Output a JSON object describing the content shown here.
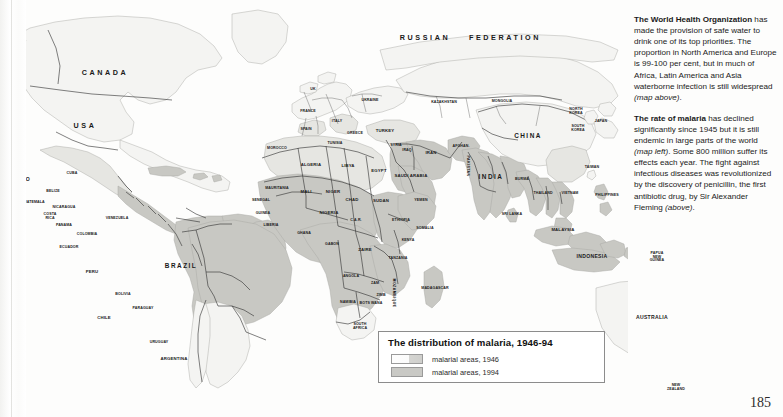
{
  "page": {
    "number": "185"
  },
  "legend": {
    "title": "The distribution of malaria, 1946-94",
    "entries": [
      {
        "label": "malarial areas, 1946",
        "swatch": "light-outline",
        "color": "#fbfbfb"
      },
      {
        "label": "malarial areas, 1994",
        "swatch": "gray-fill",
        "color": "#c9c9c5"
      }
    ]
  },
  "sidebar": {
    "paragraphs": [
      {
        "lead": "The World Health Organization",
        "body": " has made the provision of safe water to drink one of its top priorities. The proportion in North America and Europe is 99-100 per cent, but in much of Africa, Latin America and Asia waterborne infection is still widespread ",
        "italic_tail": "(map above)",
        "end": "."
      },
      {
        "lead": "The rate of malaria",
        "body": " has declined significantly since 1945 but it is still endemic in large parts of the world ",
        "italic_mid": "(map left)",
        "body2": ". Some 800 million suffer its effects each year. The fight against infectious diseases was revolutionized by the discovery of penicillin, the first antibiotic drug, by Sir Alexander Fleming ",
        "italic_tail": "(above)",
        "end": "."
      }
    ]
  },
  "map": {
    "colors": {
      "ocean": "#fdfdfc",
      "land_clear": "#f2f2f0",
      "malaria_1946": "#e3e3df",
      "malaria_1994": "#c6c6c1",
      "border": "#3a3a3a",
      "coast": "#9a9a96"
    },
    "labels": [
      {
        "text": "CANADA",
        "x": 105,
        "y": 73,
        "size": "xl"
      },
      {
        "text": "USA",
        "x": 85,
        "y": 126,
        "size": "xl"
      },
      {
        "text": "MEXICO",
        "x": 19,
        "y": 180,
        "size": "m"
      },
      {
        "text": "CUBA",
        "x": 72,
        "y": 174,
        "size": "xs"
      },
      {
        "text": "BELIZE",
        "x": 53,
        "y": 192,
        "size": "xs"
      },
      {
        "text": "GUATEMALA",
        "x": 33,
        "y": 203,
        "size": "xs"
      },
      {
        "text": "NICARAGUA",
        "x": 64,
        "y": 208,
        "size": "xs"
      },
      {
        "text": "COSTA RICA",
        "x": 50,
        "y": 217,
        "size": "xs"
      },
      {
        "text": "PANAMA",
        "x": 64,
        "y": 226,
        "size": "xs"
      },
      {
        "text": "VENEZUELA",
        "x": 117,
        "y": 219,
        "size": "xs"
      },
      {
        "text": "COLOMBIA",
        "x": 87,
        "y": 235,
        "size": "xs"
      },
      {
        "text": "ECUADOR",
        "x": 69,
        "y": 248,
        "size": "xs"
      },
      {
        "text": "PERU",
        "x": 92,
        "y": 272,
        "size": "s"
      },
      {
        "text": "BRAZIL",
        "x": 181,
        "y": 266,
        "size": "l"
      },
      {
        "text": "BOLIVIA",
        "x": 123,
        "y": 295,
        "size": "xs"
      },
      {
        "text": "PARAGUAY",
        "x": 143,
        "y": 309,
        "size": "xs"
      },
      {
        "text": "CHILE",
        "x": 104,
        "y": 318,
        "size": "s"
      },
      {
        "text": "URUGUAY",
        "x": 159,
        "y": 343,
        "size": "xs"
      },
      {
        "text": "ARGENTINA",
        "x": 174,
        "y": 359,
        "size": "s"
      },
      {
        "text": "UK",
        "x": 313,
        "y": 90,
        "size": "xs"
      },
      {
        "text": "FRANCE",
        "x": 308,
        "y": 112,
        "size": "xs"
      },
      {
        "text": "SPAIN",
        "x": 306,
        "y": 130,
        "size": "xs"
      },
      {
        "text": "ITALY",
        "x": 337,
        "y": 122,
        "size": "xs"
      },
      {
        "text": "UKRAINE",
        "x": 370,
        "y": 101,
        "size": "xs"
      },
      {
        "text": "GREECE",
        "x": 355,
        "y": 134,
        "size": "xs"
      },
      {
        "text": "TURKEY",
        "x": 385,
        "y": 131,
        "size": "s"
      },
      {
        "text": "KAZAKHSTAN",
        "x": 444,
        "y": 103,
        "size": "xs"
      },
      {
        "text": "MONGOLIA",
        "x": 502,
        "y": 102,
        "size": "xs"
      },
      {
        "text": "RUSSIAN",
        "x": 425,
        "y": 38,
        "size": "xl"
      },
      {
        "text": "FEDERATION",
        "x": 505,
        "y": 38,
        "size": "xl"
      },
      {
        "text": "CHINA",
        "x": 528,
        "y": 136,
        "size": "l"
      },
      {
        "text": "NORTH KOREA",
        "x": 576,
        "y": 112,
        "size": "xs"
      },
      {
        "text": "SOUTH KOREA",
        "x": 578,
        "y": 129,
        "size": "xs"
      },
      {
        "text": "JAPAN",
        "x": 601,
        "y": 122,
        "size": "xs"
      },
      {
        "text": "TAIWAN",
        "x": 592,
        "y": 168,
        "size": "xs"
      },
      {
        "text": "SYRIA",
        "x": 396,
        "y": 146,
        "size": "xs"
      },
      {
        "text": "IRAQ",
        "x": 407,
        "y": 151,
        "size": "xs"
      },
      {
        "text": "IRAN",
        "x": 431,
        "y": 153,
        "size": "s"
      },
      {
        "text": "AFGHAN.",
        "x": 461,
        "y": 147,
        "size": "xs"
      },
      {
        "text": "PAKISTAN",
        "x": 467,
        "y": 166,
        "size": "xs",
        "vertical": true
      },
      {
        "text": "SAUDI ARABIA",
        "x": 411,
        "y": 176,
        "size": "s"
      },
      {
        "text": "YEMEN",
        "x": 421,
        "y": 201,
        "size": "xs"
      },
      {
        "text": "INDIA",
        "x": 491,
        "y": 177,
        "size": "l"
      },
      {
        "text": "SRI LANKA",
        "x": 512,
        "y": 215,
        "size": "xs"
      },
      {
        "text": "BURMA",
        "x": 522,
        "y": 180,
        "size": "xs"
      },
      {
        "text": "THAILAND",
        "x": 543,
        "y": 194,
        "size": "xs"
      },
      {
        "text": "VIETNAM",
        "x": 570,
        "y": 194,
        "size": "xs"
      },
      {
        "text": "PHILIPPINES",
        "x": 607,
        "y": 196,
        "size": "xs"
      },
      {
        "text": "MALAYSIA",
        "x": 563,
        "y": 230,
        "size": "s"
      },
      {
        "text": "INDONESIA",
        "x": 592,
        "y": 257,
        "size": "m"
      },
      {
        "text": "PAPUA NEW GUINEA",
        "x": 657,
        "y": 257,
        "size": "xs"
      },
      {
        "text": "AUSTRALIA",
        "x": 652,
        "y": 318,
        "size": "m"
      },
      {
        "text": "NEW ZEALAND",
        "x": 676,
        "y": 388,
        "size": "xs"
      },
      {
        "text": "MOROCCO",
        "x": 277,
        "y": 149,
        "size": "xs"
      },
      {
        "text": "TUNISIA",
        "x": 335,
        "y": 144,
        "size": "xs"
      },
      {
        "text": "ALGERIA",
        "x": 311,
        "y": 165,
        "size": "s"
      },
      {
        "text": "LIBYA",
        "x": 348,
        "y": 166,
        "size": "s"
      },
      {
        "text": "EGYPT",
        "x": 379,
        "y": 171,
        "size": "s"
      },
      {
        "text": "MAURITANIA",
        "x": 277,
        "y": 189,
        "size": "xs"
      },
      {
        "text": "MALI",
        "x": 306,
        "y": 192,
        "size": "s"
      },
      {
        "text": "NIGER",
        "x": 333,
        "y": 192,
        "size": "s"
      },
      {
        "text": "SENEGAL",
        "x": 261,
        "y": 201,
        "size": "xs"
      },
      {
        "text": "GUINEA",
        "x": 263,
        "y": 214,
        "size": "xs"
      },
      {
        "text": "LIBERIA",
        "x": 271,
        "y": 226,
        "size": "xs"
      },
      {
        "text": "GHANA",
        "x": 304,
        "y": 234,
        "size": "xs"
      },
      {
        "text": "NIGERIA",
        "x": 329,
        "y": 213,
        "size": "s"
      },
      {
        "text": "CHAD",
        "x": 352,
        "y": 200,
        "size": "s"
      },
      {
        "text": "SUDAN",
        "x": 381,
        "y": 201,
        "size": "s"
      },
      {
        "text": "C.A.R.",
        "x": 356,
        "y": 221,
        "size": "xs"
      },
      {
        "text": "ETHIOPIA",
        "x": 401,
        "y": 221,
        "size": "xs"
      },
      {
        "text": "SOMALIA",
        "x": 425,
        "y": 229,
        "size": "xs"
      },
      {
        "text": "KENYA",
        "x": 408,
        "y": 241,
        "size": "xs"
      },
      {
        "text": "GABON",
        "x": 332,
        "y": 245,
        "size": "xs"
      },
      {
        "text": "ZAIRE",
        "x": 365,
        "y": 250,
        "size": "s"
      },
      {
        "text": "TANZANIA",
        "x": 398,
        "y": 259,
        "size": "xs"
      },
      {
        "text": "ANGOLA",
        "x": 351,
        "y": 277,
        "size": "xs"
      },
      {
        "text": "ZAM",
        "x": 375,
        "y": 284,
        "size": "xs"
      },
      {
        "text": "ZIMB",
        "x": 381,
        "y": 296,
        "size": "xs"
      },
      {
        "text": "MOZAMBIQUE",
        "x": 393,
        "y": 293,
        "size": "xs",
        "vertical": true
      },
      {
        "text": "MADAGASCAR",
        "x": 435,
        "y": 289,
        "size": "xs"
      },
      {
        "text": "NAMIBIA",
        "x": 348,
        "y": 303,
        "size": "xs"
      },
      {
        "text": "BOTS WANA",
        "x": 371,
        "y": 304,
        "size": "xs"
      },
      {
        "text": "SOUTH AFRICA",
        "x": 360,
        "y": 327,
        "size": "xs"
      }
    ]
  }
}
